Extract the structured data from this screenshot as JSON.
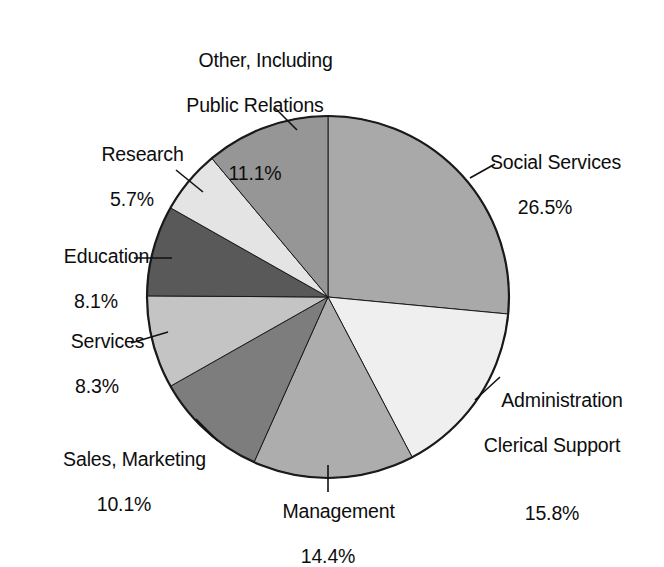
{
  "chart_data": {
    "type": "pie",
    "title": "",
    "subtitle": "",
    "xlabel": "",
    "ylabel": "",
    "grid": false,
    "legend": "none",
    "labels_position": "outside-with-leader-lines",
    "start_angle_deg": 0,
    "direction": "clockwise",
    "categories": [
      "Social Services",
      "Administration Clerical Support",
      "Management",
      "Sales, Marketing",
      "Services",
      "Education",
      "Research",
      "Other, Including Public Relations"
    ],
    "values": [
      26.5,
      15.8,
      14.4,
      10.1,
      8.3,
      8.1,
      5.7,
      11.1
    ],
    "value_unit": "%",
    "total": 100.0,
    "slices": [
      {
        "name": "Social Services",
        "label_line1": "Social Services",
        "label_line2": "",
        "value": 26.5,
        "value_text": "26.5%",
        "color": "#a9a9a9",
        "start_deg": 0.0,
        "end_deg": 95.4
      },
      {
        "name": "Administration Clerical Support",
        "label_line1": "Administration",
        "label_line2": "Clerical Support",
        "value": 15.8,
        "value_text": "15.8%",
        "color": "#efefef",
        "start_deg": 95.4,
        "end_deg": 152.28
      },
      {
        "name": "Management",
        "label_line1": "Management",
        "label_line2": "",
        "value": 14.4,
        "value_text": "14.4%",
        "color": "#adadad",
        "start_deg": 152.28,
        "end_deg": 204.12
      },
      {
        "name": "Sales, Marketing",
        "label_line1": "Sales, Marketing",
        "label_line2": "",
        "value": 10.1,
        "value_text": "10.1%",
        "color": "#7d7d7d",
        "start_deg": 204.12,
        "end_deg": 240.48
      },
      {
        "name": "Services",
        "label_line1": "Services",
        "label_line2": "",
        "value": 8.3,
        "value_text": "8.3%",
        "color": "#c4c4c4",
        "start_deg": 240.48,
        "end_deg": 270.36
      },
      {
        "name": "Education",
        "label_line1": "Education",
        "label_line2": "",
        "value": 8.1,
        "value_text": "8.1%",
        "color": "#595959",
        "start_deg": 270.36,
        "end_deg": 299.52
      },
      {
        "name": "Research",
        "label_line1": "Research",
        "label_line2": "",
        "value": 5.7,
        "value_text": "5.7%",
        "color": "#e4e4e4",
        "start_deg": 299.52,
        "end_deg": 320.04
      },
      {
        "name": "Other, Including Public Relations",
        "label_line1": "Other, Including",
        "label_line2": "Public Relations",
        "value": 11.1,
        "value_text": "11.1%",
        "color": "#969696",
        "start_deg": 320.04,
        "end_deg": 360.0
      }
    ],
    "style": {
      "outline_color": "#1a1a1a",
      "background": "#ffffff",
      "text_color": "#0d0d0d"
    }
  }
}
